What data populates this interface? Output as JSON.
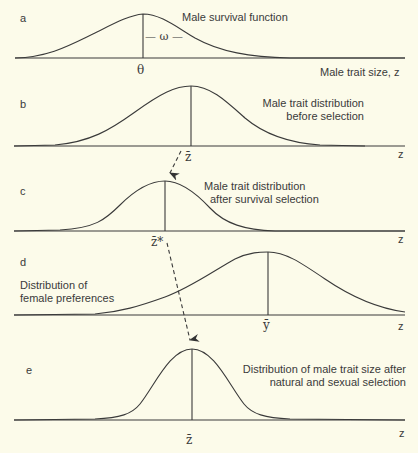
{
  "panels": {
    "a": {
      "letter": "a",
      "title": "Male survival function",
      "peak_symbol": "θ",
      "width_symbol": "— ω —",
      "axis_label": "Male trait size, z"
    },
    "b": {
      "letter": "b",
      "title_line1": "Male trait distribution",
      "title_line2": "before selection",
      "mean_symbol": "z̄",
      "axis_label": "z"
    },
    "c": {
      "letter": "c",
      "title_line1": "Male trait distribution",
      "title_line2": "after survival selection",
      "mean_symbol": "z̄*",
      "axis_label": "z"
    },
    "d": {
      "letter": "d",
      "title_line1": "Distribution of",
      "title_line2": "female preferences",
      "mean_symbol": "ȳ",
      "axis_label": "z"
    },
    "e": {
      "letter": "e",
      "title_line1": "Distribution of male trait size after",
      "title_line2": "natural and sexual selection",
      "mean_symbol": "z̄",
      "axis_label": "z"
    }
  },
  "arrows": [
    {
      "from": "b",
      "to": "c",
      "style": "dashed"
    },
    {
      "from": "c",
      "to": "e",
      "style": "dashed",
      "crosses": "d"
    }
  ],
  "colors": {
    "background": "#fcfbea",
    "ink": "#3a3a3a"
  }
}
